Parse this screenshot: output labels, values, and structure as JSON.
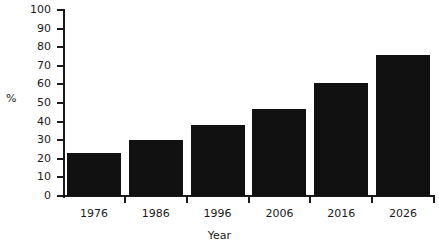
{
  "chart_data": {
    "type": "bar",
    "title": "",
    "categories": [
      "1976",
      "1986",
      "1996",
      "2006",
      "2016",
      "2026"
    ],
    "values": [
      23,
      30,
      38,
      47,
      61,
      76
    ],
    "series": [
      {
        "name": "%",
        "values": [
          23,
          30,
          38,
          47,
          61,
          76
        ]
      }
    ],
    "xlabel": "Year",
    "ylabel": "%",
    "ylim": [
      0,
      100
    ],
    "ytick_values": [
      0,
      10,
      20,
      30,
      40,
      50,
      60,
      70,
      80,
      90,
      100
    ],
    "ytick_labels": [
      "0",
      "10",
      "20",
      "30",
      "40",
      "50",
      "60",
      "70",
      "80",
      "90",
      "100"
    ],
    "xtick_labels": [
      "1976",
      "1986",
      "1996",
      "2006",
      "2016",
      "2026"
    ],
    "grid": false,
    "legend": false,
    "bar_color": "#111111",
    "axis_color": "#1a1a1a",
    "background_color": "#ffffff"
  }
}
